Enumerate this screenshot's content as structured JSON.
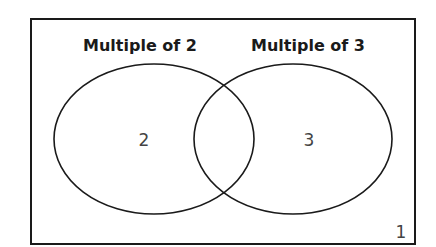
{
  "diagram": {
    "type": "venn",
    "universe_label": "1",
    "sets": [
      {
        "label": "Multiple of 2",
        "only_value": "2"
      },
      {
        "label": "Multiple of 3",
        "only_value": "3"
      }
    ],
    "intersection_value": ""
  },
  "colors": {
    "stroke": "#1a1a1a",
    "background": "#ffffff"
  }
}
